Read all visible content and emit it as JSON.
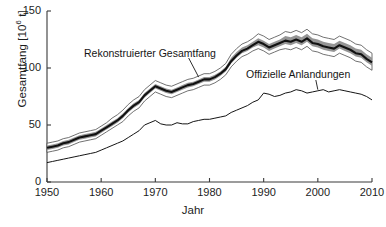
{
  "chart_data": {
    "type": "line",
    "title": "",
    "xlabel": "Jahr",
    "ylabel": "Gesamtfang [10⁶ t]",
    "ylabel_base": "Gesamtfang [10",
    "ylabel_exp": "6",
    "ylabel_tail": " t]",
    "xlim": [
      1950,
      2010
    ],
    "ylim": [
      0,
      150
    ],
    "xticks": [
      1950,
      1960,
      1970,
      1980,
      1990,
      2000,
      2010
    ],
    "xticklabels": [
      "1950",
      "1960",
      "1970",
      "1980",
      "1990",
      "2000",
      "2010"
    ],
    "yticks": [
      0,
      50,
      100,
      150
    ],
    "yticklabels": [
      "0",
      "50",
      "100",
      "150"
    ],
    "grid": false,
    "legend": "annotations-inline",
    "annotations": [
      {
        "name": "rekonstruierter-gesamtfang",
        "text": "Rekonstruierter Gesamtfang",
        "points_to_year": 1978,
        "points_to_value": 92
      },
      {
        "name": "offizielle-anlandungen",
        "text": "Offizielle Anlandungen",
        "points_to_year": 2000,
        "points_to_value": 81
      }
    ],
    "colors": {
      "line": "#111111",
      "band_inner": "#8a8a8a",
      "band_outer": "#ffffff",
      "band_edge": "#5a5a5a",
      "axis": "#3a3a3a",
      "background": "#ffffff"
    },
    "x": [
      1950,
      1951,
      1952,
      1953,
      1954,
      1955,
      1956,
      1957,
      1958,
      1959,
      1960,
      1961,
      1962,
      1963,
      1964,
      1965,
      1966,
      1967,
      1968,
      1969,
      1970,
      1971,
      1972,
      1973,
      1974,
      1975,
      1976,
      1977,
      1978,
      1979,
      1980,
      1981,
      1982,
      1983,
      1984,
      1985,
      1986,
      1987,
      1988,
      1989,
      1990,
      1991,
      1992,
      1993,
      1994,
      1995,
      1996,
      1997,
      1998,
      1999,
      2000,
      2001,
      2002,
      2003,
      2004,
      2005,
      2006,
      2007,
      2008,
      2009,
      2010
    ],
    "series": [
      {
        "name": "Rekonstruierter Gesamtfang",
        "style": "thick-black-with-uncertainty-band",
        "values": [
          30,
          31,
          32,
          34,
          35,
          37,
          39,
          40,
          41,
          42,
          45,
          48,
          51,
          54,
          58,
          63,
          67,
          70,
          76,
          80,
          84,
          82,
          80,
          79,
          81,
          83,
          85,
          86,
          88,
          90,
          90,
          92,
          95,
          99,
          106,
          111,
          115,
          117,
          120,
          123,
          121,
          118,
          120,
          122,
          124,
          123,
          125,
          123,
          126,
          122,
          121,
          119,
          118,
          117,
          120,
          118,
          116,
          113,
          112,
          108,
          105
        ],
        "upper": [
          34,
          35,
          36,
          38,
          39,
          41,
          43,
          44,
          45,
          46,
          49,
          52,
          56,
          59,
          63,
          68,
          72,
          75,
          81,
          85,
          89,
          87,
          85,
          84,
          86,
          88,
          90,
          91,
          93,
          95,
          95,
          97,
          100,
          104,
          112,
          117,
          121,
          123,
          126,
          130,
          128,
          125,
          127,
          129,
          132,
          131,
          133,
          131,
          134,
          130,
          129,
          127,
          126,
          125,
          128,
          126,
          124,
          121,
          120,
          116,
          113
        ],
        "lower": [
          26,
          27,
          28,
          30,
          31,
          33,
          35,
          36,
          37,
          38,
          41,
          44,
          47,
          50,
          53,
          58,
          62,
          65,
          71,
          75,
          79,
          77,
          75,
          74,
          76,
          78,
          80,
          81,
          83,
          85,
          85,
          87,
          90,
          94,
          101,
          106,
          110,
          112,
          115,
          117,
          115,
          112,
          114,
          116,
          117,
          116,
          118,
          116,
          119,
          115,
          114,
          112,
          111,
          110,
          113,
          111,
          109,
          106,
          105,
          101,
          98
        ],
        "upper_inner": [
          32,
          33,
          34,
          36,
          37,
          39,
          41,
          42,
          43,
          44,
          47,
          50,
          53,
          56,
          60,
          65,
          69,
          72,
          78,
          82,
          86,
          84,
          82,
          81,
          83,
          85,
          87,
          88,
          90,
          92,
          92,
          94,
          97,
          101,
          109,
          114,
          118,
          120,
          123,
          126,
          124,
          121,
          123,
          125,
          128,
          127,
          129,
          127,
          130,
          126,
          125,
          123,
          122,
          121,
          124,
          122,
          120,
          117,
          116,
          112,
          109
        ],
        "lower_inner": [
          28,
          29,
          30,
          32,
          33,
          35,
          37,
          38,
          39,
          40,
          43,
          46,
          49,
          52,
          56,
          61,
          65,
          68,
          74,
          78,
          82,
          80,
          78,
          77,
          79,
          81,
          83,
          84,
          86,
          88,
          88,
          90,
          93,
          97,
          104,
          109,
          113,
          115,
          118,
          120,
          118,
          115,
          117,
          119,
          121,
          120,
          122,
          120,
          123,
          119,
          118,
          116,
          115,
          114,
          117,
          115,
          113,
          110,
          109,
          105,
          102
        ]
      },
      {
        "name": "Offizielle Anlandungen",
        "style": "thin-black-line",
        "values": [
          17,
          18,
          19,
          20,
          21,
          22,
          23,
          24,
          25,
          26,
          28,
          30,
          32,
          34,
          36,
          39,
          42,
          45,
          50,
          52,
          54,
          51,
          50,
          50,
          52,
          51,
          51,
          53,
          54,
          55,
          55,
          56,
          57,
          58,
          61,
          63,
          65,
          67,
          70,
          72,
          78,
          77,
          75,
          76,
          78,
          79,
          81,
          80,
          78,
          79,
          80,
          81,
          79,
          80,
          81,
          80,
          79,
          78,
          77,
          75,
          72
        ]
      }
    ]
  }
}
